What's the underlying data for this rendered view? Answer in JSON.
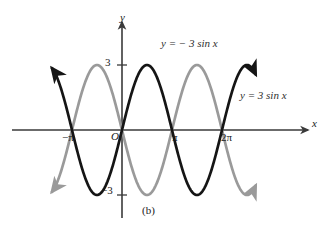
{
  "figure": {
    "caption": "(b)",
    "background_color": "#ffffff"
  },
  "axes": {
    "x_axis_label": "x",
    "y_axis_label": "y",
    "origin_label": "O",
    "axis_color": "#3a3a3a",
    "x_ticks": [
      {
        "label": "−π",
        "value": -3.14159
      },
      {
        "label": "π",
        "value": 3.14159
      },
      {
        "label": "2π",
        "value": 6.28319
      }
    ],
    "y_ticks": [
      {
        "label": "3",
        "value": 3
      },
      {
        "label": "−3",
        "value": -3
      }
    ]
  },
  "annotations": {
    "curve_label_gray": "y = − 3 sin x",
    "curve_label_black": "y = 3 sin x"
  },
  "chart_data": {
    "type": "line",
    "title": "",
    "subtitle": "",
    "xlabel": "x",
    "ylabel": "y",
    "xlim": [
      -4.4,
      8.4
    ],
    "ylim": [
      -4.1,
      4.1
    ],
    "grid": false,
    "legend_position": "inline-annotation",
    "xtick_labels": [
      "−π",
      "π",
      "2π"
    ],
    "xtick_values": [
      -3.14159,
      3.14159,
      6.28319
    ],
    "ytick_labels": [
      "3",
      "−3"
    ],
    "ytick_values": [
      3,
      -3
    ],
    "series": [
      {
        "name": "y = 3 sin x",
        "color": "#151515",
        "amplitude": 3,
        "period": 6.28319,
        "phase": 0,
        "formula": "y = 3*sin(x)",
        "linewidth": 2.6,
        "arrow_start": {
          "x": -4.4,
          "y": 2.4,
          "direction": "up-left"
        },
        "arrow_end": {
          "x": 8.1,
          "y": 2.4,
          "direction": "down-right"
        },
        "x": [
          -4.4,
          -3.93,
          -3.46,
          -2.99,
          -2.51,
          -2.04,
          -1.57,
          -1.1,
          -0.63,
          -0.16,
          0.31,
          0.79,
          1.26,
          1.73,
          2.2,
          2.67,
          3.14,
          3.61,
          4.08,
          4.55,
          5.03,
          5.5,
          5.97,
          6.44,
          6.91,
          7.38,
          7.85,
          8.1
        ],
        "y": [
          2.83,
          2.15,
          0.93,
          -0.46,
          -1.78,
          -2.68,
          -3.0,
          -2.68,
          -1.78,
          -0.48,
          0.92,
          2.12,
          2.86,
          2.96,
          2.41,
          1.35,
          0.0,
          -1.35,
          -2.41,
          -2.96,
          -2.86,
          -2.12,
          -0.92,
          0.48,
          1.78,
          2.68,
          3.0,
          2.83
        ]
      },
      {
        "name": "y = − 3 sin x",
        "color": "#9a9a9a",
        "amplitude": -3,
        "period": 6.28319,
        "phase": 0,
        "formula": "y = -3*sin(x)",
        "linewidth": 2.6,
        "arrow_start": {
          "x": -4.4,
          "y": -2.4,
          "direction": "up-left"
        },
        "arrow_end": {
          "x": 8.1,
          "y": -2.4,
          "direction": "up-right"
        },
        "x": [
          -4.4,
          -3.93,
          -3.46,
          -2.99,
          -2.51,
          -2.04,
          -1.57,
          -1.1,
          -0.63,
          -0.16,
          0.31,
          0.79,
          1.26,
          1.73,
          2.2,
          2.67,
          3.14,
          3.61,
          4.08,
          4.55,
          5.03,
          5.5,
          5.97,
          6.44,
          6.91,
          7.38,
          7.85,
          8.1
        ],
        "y": [
          -2.83,
          -2.15,
          -0.93,
          0.46,
          1.78,
          2.68,
          3.0,
          2.68,
          1.78,
          0.48,
          -0.92,
          -2.12,
          -2.86,
          -2.96,
          -2.41,
          -1.35,
          0.0,
          1.35,
          2.41,
          2.96,
          2.86,
          2.12,
          0.92,
          -0.48,
          -1.78,
          -2.68,
          -3.0,
          -2.83
        ]
      }
    ]
  }
}
